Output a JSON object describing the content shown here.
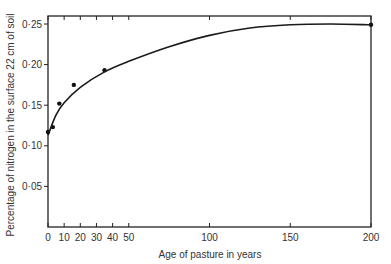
{
  "chart_data": {
    "type": "line",
    "title": "",
    "xlabel": "Age of pasture in years",
    "ylabel": "Percentage of nitrogen in the surface 22 cm of soil",
    "xlim": [
      0,
      200
    ],
    "ylim": [
      0,
      0.26
    ],
    "grid": false,
    "legend": null,
    "x_ticks": [
      0,
      10,
      20,
      30,
      40,
      50,
      100,
      150,
      200
    ],
    "x_tick_labels": [
      "0",
      "10",
      "20",
      "30",
      "40",
      "50",
      "100",
      "150",
      "200"
    ],
    "y_ticks": [
      0.05,
      0.1,
      0.15,
      0.2,
      0.25
    ],
    "y_tick_labels": [
      "0·05",
      "0·10",
      "0·15",
      "0·20",
      "0·25"
    ],
    "series": [
      {
        "name": "observed",
        "style": "points",
        "x": [
          0,
          3,
          7,
          16,
          35,
          200
        ],
        "y": [
          0.117,
          0.123,
          0.152,
          0.175,
          0.193,
          0.249
        ]
      },
      {
        "name": "fitted curve",
        "style": "line",
        "x": [
          0,
          5,
          10,
          20,
          35,
          50,
          75,
          100,
          125,
          150,
          175,
          200
        ],
        "y": [
          0.113,
          0.138,
          0.153,
          0.172,
          0.191,
          0.204,
          0.222,
          0.236,
          0.245,
          0.249,
          0.25,
          0.249
        ]
      }
    ]
  }
}
